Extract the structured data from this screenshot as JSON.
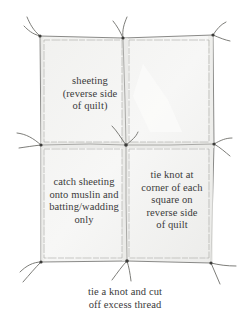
{
  "diagram": {
    "colors": {
      "background": "#ffffff",
      "fabric_fill": "#f3f3f1",
      "fabric_shade": "#e6e6e3",
      "outline": "#7d7d7a",
      "seam": "#a9a9a6",
      "thread": "#6e6e6a",
      "knot": "#3c3c3a",
      "text": "#3a3a3a"
    },
    "quilt": {
      "outer": {
        "x1": 40,
        "y1": 36,
        "x2": 213,
        "y2": 262
      },
      "middle_seam_x": 125,
      "middle_seam_y": 145,
      "squares": [
        {
          "id": "top-left",
          "x": 44,
          "y": 40,
          "w": 78,
          "h": 102
        },
        {
          "id": "top-right",
          "x": 129,
          "y": 40,
          "w": 80,
          "h": 102
        },
        {
          "id": "bottom-left",
          "x": 44,
          "y": 149,
          "w": 78,
          "h": 109
        },
        {
          "id": "bottom-right",
          "x": 129,
          "y": 149,
          "w": 80,
          "h": 109
        }
      ]
    },
    "knots": [
      {
        "id": "top-left",
        "x": 40,
        "y": 36
      },
      {
        "id": "top-middle",
        "x": 123,
        "y": 38
      },
      {
        "id": "top-right",
        "x": 213,
        "y": 35
      },
      {
        "id": "middle-left",
        "x": 41,
        "y": 145
      },
      {
        "id": "middle-center",
        "x": 126,
        "y": 145
      },
      {
        "id": "middle-right",
        "x": 214,
        "y": 144
      },
      {
        "id": "bottom-left",
        "x": 41,
        "y": 262
      },
      {
        "id": "bottom-middle",
        "x": 127,
        "y": 261
      },
      {
        "id": "bottom-right",
        "x": 211,
        "y": 263
      }
    ],
    "labels": {
      "top_left": "sheeting\n(reverse side\nof quilt)",
      "bottom_left": "catch sheeting\nonto muslin and\nbatting/wadding\nonly",
      "bottom_right": "tie knot at\ncorner of each\nsquare on\nreverse side\nof quilt",
      "bottom": "tie a knot and cut\noff excess thread"
    }
  }
}
